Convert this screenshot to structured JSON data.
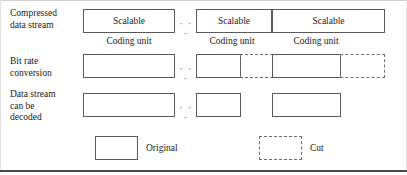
{
  "figure": {
    "colors": {
      "solid_border": "#5a5a5a",
      "dashed_border": "#6e6e6e",
      "text": "#1a1a1a",
      "frame_rule": "#4a4a4a",
      "background": "#ffffff"
    },
    "ellipsis": "· · ·"
  },
  "rows": [
    {
      "id": "compressed-data-stream",
      "label": "Compressed\ndata stream",
      "segments": [
        {
          "id": "cu1-scalable",
          "text": "Scalable",
          "style": "solid"
        },
        {
          "id": "cu2-scalable",
          "text": "Scalable",
          "style": "solid"
        },
        {
          "id": "cu3-scalable",
          "text": "Scalable",
          "style": "solid"
        }
      ],
      "unit_labels": [
        "Coding unit",
        "Coding unit",
        "Coding unit"
      ]
    },
    {
      "id": "bit-rate-conversion",
      "label": "Bit rate\nconversion",
      "segments": [
        {
          "id": "brc1-original",
          "text": "",
          "style": "solid"
        },
        {
          "id": "brc2-original",
          "text": "",
          "style": "solid"
        },
        {
          "id": "brc2-cut",
          "text": "",
          "style": "dashed"
        },
        {
          "id": "brc3-original",
          "text": "",
          "style": "solid"
        },
        {
          "id": "brc3-cut",
          "text": "",
          "style": "dashed"
        }
      ]
    },
    {
      "id": "data-stream-can-be-decoded",
      "label": "Data stream\ncan be\ndecoded",
      "segments": [
        {
          "id": "dec1-original",
          "text": "",
          "style": "solid"
        },
        {
          "id": "dec2-original",
          "text": "",
          "style": "solid"
        },
        {
          "id": "dec3-original",
          "text": "",
          "style": "solid"
        }
      ]
    }
  ],
  "legend": {
    "items": [
      {
        "id": "legend-original",
        "label": "Original",
        "style": "solid"
      },
      {
        "id": "legend-cut",
        "label": "Cut",
        "style": "dashed"
      }
    ]
  }
}
